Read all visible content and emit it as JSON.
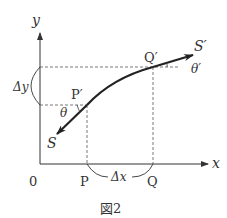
{
  "figure": {
    "caption": "図2",
    "axes": {
      "x_label": "x",
      "y_label": "y",
      "origin_label": "0"
    },
    "points": {
      "P": "P",
      "Q": "Q",
      "P_prime": "P′",
      "Q_prime": "Q′",
      "S": "S",
      "S_prime": "S′"
    },
    "angles": {
      "theta": "θ",
      "theta_prime": "θ′"
    },
    "increments": {
      "delta_x": "Δx",
      "delta_y": "Δy"
    },
    "colors": {
      "line": "#333333",
      "curve": "#222222",
      "dashed": "#555555"
    }
  }
}
